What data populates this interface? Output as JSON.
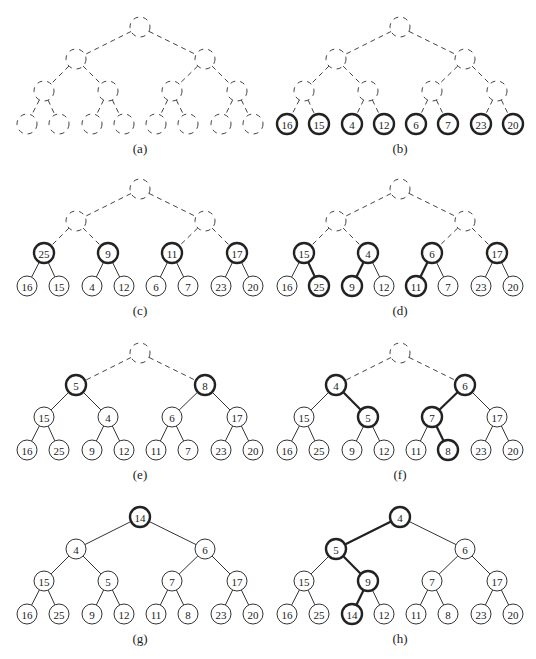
{
  "figure": {
    "node_radius": 10,
    "panels": [
      {
        "id": "a",
        "caption": "(a)",
        "origin": [
          0,
          0
        ],
        "values": [
          null,
          null,
          null,
          null,
          null,
          null,
          null,
          null,
          null,
          null,
          null,
          null,
          null,
          null,
          null
        ],
        "node_style": [
          "dashed",
          "dashed",
          "dashed",
          "dashed",
          "dashed",
          "dashed",
          "dashed",
          "dashed",
          "dashed",
          "dashed",
          "dashed",
          "dashed",
          "dashed",
          "dashed",
          "dashed"
        ],
        "edge_style": [
          "dashed",
          "dashed",
          "dashed",
          "dashed",
          "dashed",
          "dashed",
          "dashed",
          "dashed",
          "dashed",
          "dashed",
          "dashed",
          "dashed",
          "dashed",
          "dashed"
        ]
      },
      {
        "id": "b",
        "caption": "(b)",
        "origin": [
          260,
          0
        ],
        "values": [
          null,
          null,
          null,
          null,
          null,
          null,
          null,
          16,
          15,
          4,
          12,
          6,
          7,
          23,
          20
        ],
        "node_style": [
          "dashed",
          "dashed",
          "dashed",
          "dashed",
          "dashed",
          "dashed",
          "dashed",
          "bold",
          "bold",
          "bold",
          "bold",
          "bold",
          "bold",
          "bold",
          "bold"
        ],
        "edge_style": [
          "dashed",
          "dashed",
          "dashed",
          "dashed",
          "dashed",
          "dashed",
          "dashed",
          "dashed",
          "dashed",
          "dashed",
          "dashed",
          "dashed",
          "dashed",
          "dashed"
        ]
      },
      {
        "id": "c",
        "caption": "(c)",
        "origin": [
          0,
          162
        ],
        "values": [
          null,
          null,
          null,
          25,
          9,
          11,
          17,
          16,
          15,
          4,
          12,
          6,
          7,
          23,
          20
        ],
        "node_style": [
          "dashed",
          "dashed",
          "dashed",
          "bold",
          "bold",
          "bold",
          "bold",
          "normal",
          "normal",
          "normal",
          "normal",
          "normal",
          "normal",
          "normal",
          "normal"
        ],
        "edge_style": [
          "dashed",
          "dashed",
          "dashed",
          "dashed",
          "dashed",
          "dashed",
          "normal",
          "normal",
          "normal",
          "normal",
          "normal",
          "normal",
          "normal",
          "normal"
        ]
      },
      {
        "id": "d",
        "caption": "(d)",
        "origin": [
          260,
          162
        ],
        "values": [
          null,
          null,
          null,
          15,
          4,
          6,
          17,
          16,
          25,
          9,
          12,
          11,
          7,
          23,
          20
        ],
        "node_style": [
          "dashed",
          "dashed",
          "dashed",
          "bold",
          "bold",
          "bold",
          "bold",
          "normal",
          "bold",
          "bold",
          "normal",
          "bold",
          "normal",
          "normal",
          "normal"
        ],
        "edge_style": [
          "dashed",
          "dashed",
          "dashed",
          "dashed",
          "dashed",
          "dashed",
          "normal",
          "bold",
          "bold",
          "normal",
          "bold",
          "normal",
          "normal",
          "normal"
        ]
      },
      {
        "id": "e",
        "caption": "(e)",
        "origin": [
          0,
          326
        ],
        "values": [
          null,
          5,
          8,
          15,
          4,
          6,
          17,
          16,
          25,
          9,
          12,
          11,
          7,
          23,
          20
        ],
        "node_style": [
          "dashed",
          "bold",
          "bold",
          "normal",
          "normal",
          "normal",
          "normal",
          "normal",
          "normal",
          "normal",
          "normal",
          "normal",
          "normal",
          "normal",
          "normal"
        ],
        "edge_style": [
          "dashed",
          "dashed",
          "normal",
          "normal",
          "normal",
          "normal",
          "normal",
          "normal",
          "normal",
          "normal",
          "normal",
          "normal",
          "normal",
          "normal"
        ]
      },
      {
        "id": "f",
        "caption": "(f)",
        "origin": [
          260,
          326
        ],
        "values": [
          null,
          4,
          6,
          15,
          5,
          7,
          17,
          16,
          25,
          9,
          12,
          11,
          8,
          23,
          20
        ],
        "node_style": [
          "dashed",
          "bold",
          "bold",
          "normal",
          "bold",
          "bold",
          "normal",
          "normal",
          "normal",
          "normal",
          "normal",
          "normal",
          "bold",
          "normal",
          "normal"
        ],
        "edge_style": [
          "dashed",
          "dashed",
          "normal",
          "bold",
          "bold",
          "normal",
          "normal",
          "normal",
          "normal",
          "normal",
          "normal",
          "bold",
          "normal",
          "normal"
        ]
      },
      {
        "id": "g",
        "caption": "(g)",
        "origin": [
          0,
          490
        ],
        "values": [
          14,
          4,
          6,
          15,
          5,
          7,
          17,
          16,
          25,
          9,
          12,
          11,
          8,
          23,
          20
        ],
        "node_style": [
          "bold",
          "normal",
          "normal",
          "normal",
          "normal",
          "normal",
          "normal",
          "normal",
          "normal",
          "normal",
          "normal",
          "normal",
          "normal",
          "normal",
          "normal"
        ],
        "edge_style": [
          "normal",
          "normal",
          "normal",
          "normal",
          "normal",
          "normal",
          "normal",
          "normal",
          "normal",
          "normal",
          "normal",
          "normal",
          "normal",
          "normal"
        ]
      },
      {
        "id": "h",
        "caption": "(h)",
        "origin": [
          260,
          490
        ],
        "values": [
          4,
          5,
          6,
          15,
          9,
          7,
          17,
          16,
          25,
          14,
          12,
          11,
          8,
          23,
          20
        ],
        "node_style": [
          "bold",
          "bold",
          "normal",
          "normal",
          "bold",
          "normal",
          "normal",
          "normal",
          "normal",
          "bold",
          "normal",
          "normal",
          "normal",
          "normal",
          "normal"
        ],
        "edge_style": [
          "bold",
          "normal",
          "normal",
          "bold",
          "normal",
          "normal",
          "normal",
          "normal",
          "bold",
          "normal",
          "normal",
          "normal",
          "normal",
          "normal"
        ]
      }
    ]
  }
}
